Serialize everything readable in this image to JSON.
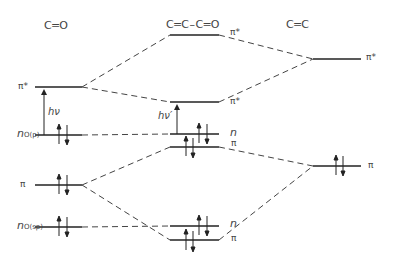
{
  "diagram": {
    "type": "molecular-orbital-energy-diagram",
    "columns": {
      "left": {
        "title": "C=O",
        "display": "C═O"
      },
      "middle": {
        "title": "C=C-C=O",
        "display": "C═C–C═O"
      },
      "right": {
        "title": "C=C",
        "display": "C═C"
      }
    },
    "levels": {
      "left_pi_star": {
        "label": "π*",
        "y": 87
      },
      "left_n_op": {
        "label": "n",
        "subscript": "O(p)",
        "y": 135,
        "electrons": 2
      },
      "left_pi": {
        "label": "π",
        "y": 185,
        "electrons": 2
      },
      "left_n_osp": {
        "label": "n",
        "subscript": "O(sp)",
        "y": 227,
        "electrons": 2
      },
      "mid_pi_star_upper": {
        "label": "π*",
        "y": 35
      },
      "mid_pi_star_lower": {
        "label": "π*",
        "y": 102
      },
      "mid_n_upper": {
        "label": "n",
        "y": 135,
        "electrons": 2
      },
      "mid_pi_upper": {
        "label": "π",
        "y": 147,
        "electrons": 2
      },
      "mid_n_lower": {
        "label": "n",
        "y": 226,
        "electrons": 2
      },
      "mid_pi_lower": {
        "label": "π",
        "y": 240,
        "electrons": 2
      },
      "right_pi_star": {
        "label": "π*",
        "y": 59
      },
      "right_pi": {
        "label": "π",
        "y": 166,
        "electrons": 2
      }
    },
    "transitions": {
      "left": {
        "label": "hν",
        "from": "n_O(p)",
        "to": "π*"
      },
      "middle": {
        "label": "hν′",
        "from": "n",
        "to": "π*"
      }
    },
    "colors": {
      "line": "#222222",
      "dash": "#444444",
      "text": "#444444"
    }
  }
}
